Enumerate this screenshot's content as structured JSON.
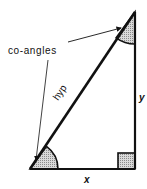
{
  "diagram": {
    "type": "right-triangle",
    "labels": {
      "co_angles": "co-angles",
      "hypotenuse": "hyp",
      "vertical_side": "y",
      "horizontal_side": "x"
    },
    "colors": {
      "stroke": "#111111",
      "shade": "#bdbdbd",
      "background": "#ffffff"
    }
  }
}
